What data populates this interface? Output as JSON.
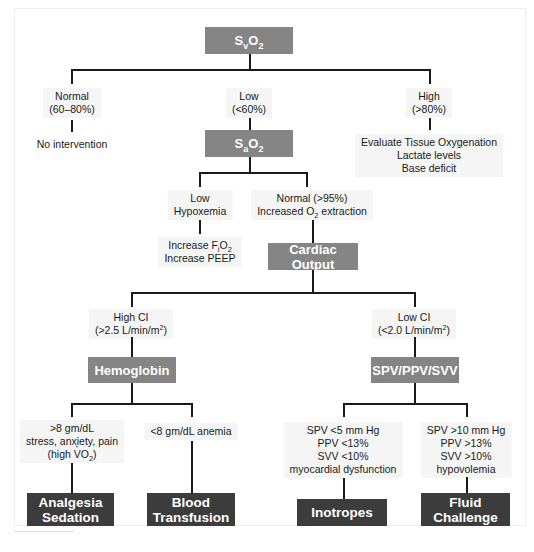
{
  "root": {
    "label_main": "S",
    "label_sub": "v",
    "label_tail": "O",
    "label_tail_sub": "2"
  },
  "level1": {
    "normal": {
      "line1": "Normal",
      "line2": "(60–80%)",
      "action": "No intervention"
    },
    "low": {
      "line1": "Low",
      "line2": "(<60%)"
    },
    "high": {
      "line1": "High",
      "line2": "(>80%)",
      "action_lines": [
        "Evaluate Tissue Oxygenation",
        "Lactate levels",
        "Base deficit"
      ]
    }
  },
  "sao2": {
    "label_main": "S",
    "label_sub": "a",
    "label_tail": "O",
    "label_tail_sub": "2"
  },
  "level2": {
    "low": {
      "line1": "Low",
      "line2": "Hypoxemia",
      "action1_pre": "Increase F",
      "action1_sub": "i",
      "action1_post": "O",
      "action1_post_sub": "2",
      "action2": "Increase PEEP"
    },
    "normal": {
      "line1": "Normal (>95%)",
      "line2_pre": "Increased O",
      "line2_sub": "2",
      "line2_post": " extraction"
    }
  },
  "cardiac_output": {
    "label": "Cardiac Output"
  },
  "level3": {
    "high_ci": {
      "line1": "High CI",
      "line2_pre": "(>2.5 L/min/m",
      "line2_sup": "2",
      "line2_post": ")"
    },
    "low_ci": {
      "line1": "Low CI",
      "line2_pre": "(<2.0 L/min/m",
      "line2_sup": "2",
      "line2_post": ")"
    }
  },
  "hemoglobin": {
    "label": "Hemoglobin"
  },
  "spv_box": {
    "label": "SPV/PPV/SVV"
  },
  "level4": {
    "hb_high": {
      "line1": ">8 gm/dL",
      "line2": "stress, anxiety, pain",
      "line3_pre": "(high ",
      "line3_v": "V",
      "line3_o": "O",
      "line3_sub": "2",
      "line3_post": ")"
    },
    "hb_low": {
      "line1": "<8 gm/dL anemia"
    },
    "spv_low": {
      "lines": [
        "SPV <5 mm Hg",
        "PPV <13%",
        "SVV <10%",
        "myocardial dysfunction"
      ]
    },
    "spv_high": {
      "lines": [
        "SPV >10 mm Hg",
        "PPV >13%",
        "SVV >10%",
        "hypovolemia"
      ]
    }
  },
  "outcomes": {
    "analgesia": {
      "line1": "Analgesia",
      "line2": "Sedation"
    },
    "transfusion": {
      "line1": "Blood",
      "line2": "Transfusion"
    },
    "inotropes": {
      "line1": "Inotropes"
    },
    "fluid": {
      "line1": "Fluid",
      "line2": "Challenge"
    }
  },
  "colors": {
    "mid_box": "#858585",
    "dark_box": "#3c3c3c",
    "line": "#1a1a1a"
  }
}
